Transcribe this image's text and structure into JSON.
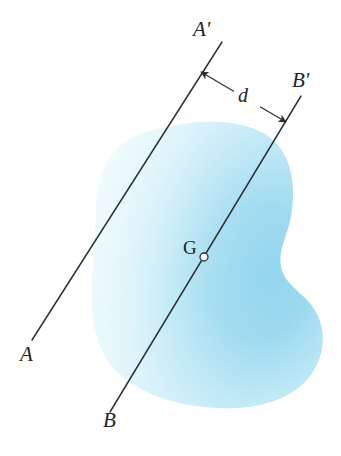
{
  "figure": {
    "background_color": "#ffffff",
    "line_color": "#2b2f36",
    "body_fill_light": "#f4fcfe",
    "body_fill_mid": "#cdeef8",
    "body_fill_dark": "#96d7ef",
    "labels": {
      "axis_a_start": "A",
      "axis_a_end": "A'",
      "axis_b_start": "B",
      "axis_b_end": "B'",
      "centroid": "G",
      "distance": "d"
    },
    "icons": {
      "centroid_marker": "open-circle-point-icon",
      "distance_arrow": "double-headed-arrow-icon"
    },
    "geometry": {
      "axis_aa_prime": {
        "x1": 32,
        "y1": 340,
        "x2": 222,
        "y2": 42
      },
      "axis_bb_prime": {
        "x1": 110,
        "y1": 412,
        "x2": 301,
        "y2": 96
      },
      "centroid_point": {
        "x": 204,
        "y": 257,
        "radius": 4
      },
      "distance_arrow": {
        "x1": 201,
        "y1": 72,
        "x2": 286,
        "y2": 122
      }
    }
  }
}
